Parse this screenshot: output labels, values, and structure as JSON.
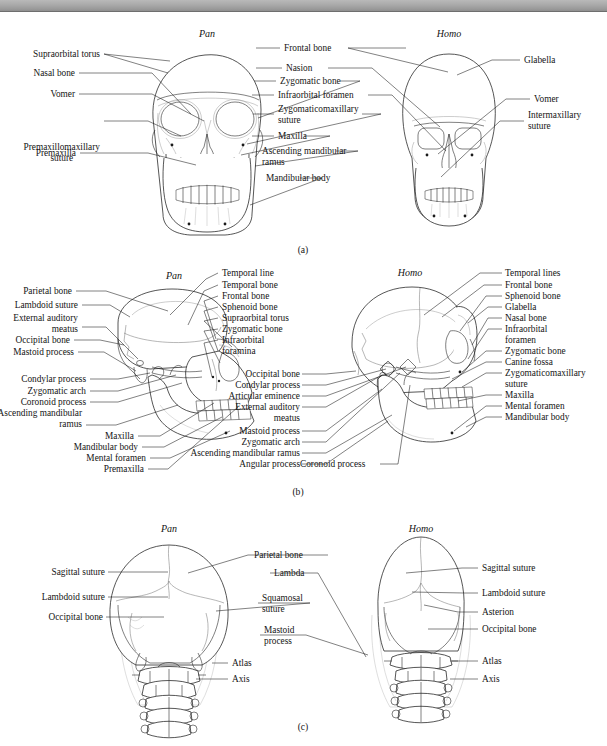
{
  "figure": {
    "banner_mark": "””",
    "panels": [
      {
        "id": "a",
        "letter": "(a)",
        "view": "anterior",
        "taxa": [
          {
            "name": "Pan"
          },
          {
            "name": "Homo"
          }
        ],
        "labels_left": [
          "Supraorbital torus",
          "Nasal bone",
          "Vomer",
          "Premaxillomaxillary\nsuture",
          "Premaxilla"
        ],
        "labels_center": [
          "Frontal bone",
          "Nasion",
          "Zygomatic bone",
          "Infraorbital foramen",
          "Zygomaticomaxillary\nsuture",
          "Maxilla",
          "Ascending mandibular\nramus",
          "Mandibular body"
        ],
        "labels_right": [
          "Glabella",
          "Vomer",
          "Intermaxillary\nsuture"
        ]
      },
      {
        "id": "b",
        "letter": "(b)",
        "view": "lateral",
        "taxa": [
          {
            "name": "Pan"
          },
          {
            "name": "Homo"
          }
        ],
        "labels_left": [
          "Parietal bone",
          "Lambdoid suture",
          "External auditory\nmeatus",
          "Occipital bone",
          "Mastoid process",
          "Condylar process",
          "Zygomatic arch",
          "Coronoid process",
          "Ascending mandibular\nramus",
          "Maxilla",
          "Mandibular body",
          "Mental foramen",
          "Premaxilla"
        ],
        "labels_center_pan": [
          "Temporal line",
          "Temporal bone",
          "Frontal bone",
          "Sphenoid bone",
          "Supraorbital torus",
          "Zygomatic bone",
          "Infraorbital\nforamina"
        ],
        "labels_center_homo": [
          "Occipital bone",
          "Condylar process",
          "Articular eminence",
          "External auditory\nmeatus",
          "Mastoid process",
          "Zygomatic arch",
          "Ascending mandibular ramus",
          "Angular process",
          "Coronoid process"
        ],
        "labels_right": [
          "Temporal lines",
          "Frontal bone",
          "Sphenoid bone",
          "Glabella",
          "Nasal bone",
          "Infraorbital\nforamen",
          "Zygomatic bone",
          "Canine fossa",
          "Zygomaticomaxillary\nsuture",
          "Maxilla",
          "Mental foramen",
          "Mandibular body"
        ]
      },
      {
        "id": "c",
        "letter": "(c)",
        "view": "posterior",
        "taxa": [
          {
            "name": "Pan"
          },
          {
            "name": "Homo"
          }
        ],
        "labels_left": [
          "Sagittal suture",
          "Lambdoid suture",
          "Occipital bone"
        ],
        "labels_center": [
          "Parietal bone",
          "Lambda",
          "Squamosal\nsuture",
          "Mastoid\nprocess",
          "Atlas",
          "Axis"
        ],
        "labels_right": [
          "Sagittal suture",
          "Lambdoid suture",
          "Asterion",
          "Occipital bone",
          "Atlas",
          "Axis"
        ]
      }
    ]
  }
}
